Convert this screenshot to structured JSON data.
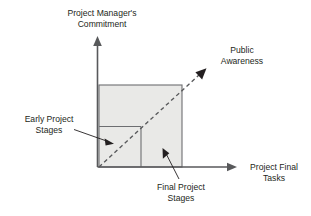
{
  "diagram": {
    "type": "conceptual-xy-diagram",
    "background_color": "#ffffff",
    "text_color": "#231f20",
    "axis_color": "#58595b",
    "region_fill_color": "#e9e9e7",
    "region_stroke_color": "#6d6e71",
    "axes": {
      "y_axis": {
        "label_line1": "Project Manager's",
        "label_line2": "Commitment",
        "name": "y-axis"
      },
      "x_axis": {
        "label_line1": "Project Final",
        "label_line2": "Tasks",
        "name": "x-axis"
      }
    },
    "trend": {
      "label_line1": "Public",
      "label_line2": "Awareness",
      "style": "dashed-arrow",
      "direction": "diagonal-up-right"
    },
    "annotations": [
      {
        "id": "early-project-stages",
        "label_line1": "Early Project",
        "label_line2": "Stages",
        "position": "left",
        "points_to": "lower-left-inner-region"
      },
      {
        "id": "final-project-stages",
        "label_line1": "Final Project",
        "label_line2": "Stages",
        "position": "bottom",
        "points_to": "lower-right-inner-region"
      }
    ],
    "regions": [
      {
        "id": "upper-region",
        "name": "upper-band"
      },
      {
        "id": "lower-left-region",
        "name": "early-stages-region"
      },
      {
        "id": "lower-right-region",
        "name": "final-stages-region"
      }
    ]
  }
}
